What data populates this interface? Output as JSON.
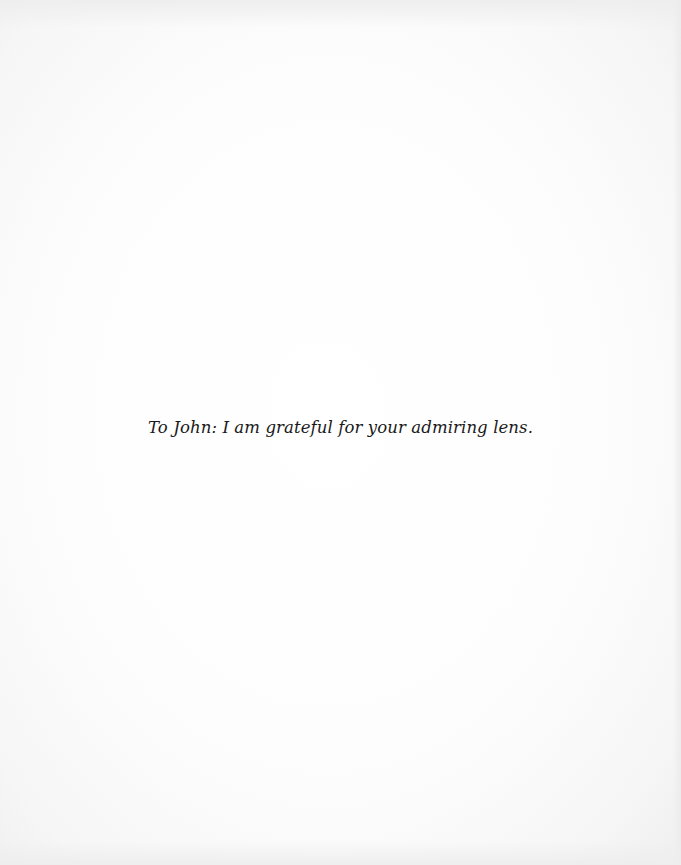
{
  "document": {
    "type": "dedication-page",
    "dedication_text": "To John: I am grateful for your admiring lens."
  },
  "colors": {
    "background": "#ffffff",
    "text": "#1a1a1a"
  }
}
